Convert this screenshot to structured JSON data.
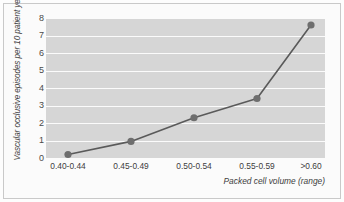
{
  "chart_data": {
    "type": "line",
    "title": "",
    "subtitle": "",
    "xlabel": "Packed cell volume (range)",
    "ylabel": "Vascular occlusive episodes per 10 patient years",
    "categories": [
      "0.40-0.44",
      "0.45-0.49",
      "0.50-0.54",
      "0.55-0.59",
      ">0.60"
    ],
    "values": [
      0.2,
      0.95,
      2.3,
      3.4,
      7.6
    ],
    "series": [
      {
        "name": "Vascular occlusive episodes",
        "values": [
          0.2,
          0.95,
          2.3,
          3.4,
          7.6
        ]
      }
    ],
    "ylim": [
      0,
      8
    ],
    "ytick_labels": [
      "0",
      "1",
      "2",
      "3",
      "4",
      "5",
      "6",
      "7",
      "8"
    ],
    "ytick_values": [
      0,
      1,
      2,
      3,
      4,
      5,
      6,
      7,
      8
    ],
    "grid": true,
    "grid_axis": "y",
    "legend": false,
    "legend_position": "none",
    "marker": "circle",
    "colors": {
      "line": "#5a5a5a",
      "marker": "#6e6e6e",
      "plot_background": "#d6d6d6",
      "gridline": "#fbfbfb",
      "figure_background": "#fbfbfb",
      "border": "#c9c9c9",
      "tick_text": "#3e3e3e"
    }
  }
}
